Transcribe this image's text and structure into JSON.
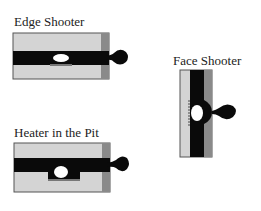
{
  "labels": {
    "edge": "Edge Shooter",
    "face": "Face Shooter",
    "pit": "Heater in the Pit"
  },
  "colors": {
    "substrate": "#d4d4d4",
    "ink_channel": "#0a0a0a",
    "nozzle_plate": "#8a8a8a",
    "heater": "#ffffff",
    "border": "#555555"
  }
}
